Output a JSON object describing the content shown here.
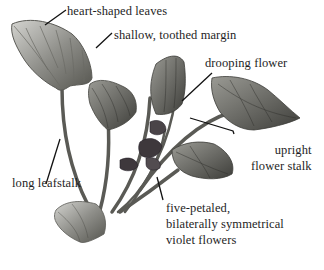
{
  "diagram": {
    "style": "pencil botanical illustration",
    "colors": {
      "background": "#ffffff",
      "leaf_dark": "#4a4a48",
      "leaf_mid": "#8a8a86",
      "leaf_light": "#c8c8c4",
      "flower": "#3a3438",
      "leader_line": "#111111",
      "text": "#1e1e1e"
    },
    "labels": [
      {
        "id": "heart-shaped-leaves",
        "text": "heart-shaped leaves"
      },
      {
        "id": "shallow-toothed-margin",
        "text": "shallow, toothed margin"
      },
      {
        "id": "drooping-flower",
        "text": "drooping flower"
      },
      {
        "id": "upright-flower-stalk",
        "lines": [
          "upright",
          "flower stalk"
        ]
      },
      {
        "id": "long-leafstalk",
        "text": "long leafstalk"
      },
      {
        "id": "violet-flowers",
        "lines": [
          "five-petaled,",
          "bilaterally symmetrical",
          "violet flowers"
        ]
      }
    ]
  }
}
